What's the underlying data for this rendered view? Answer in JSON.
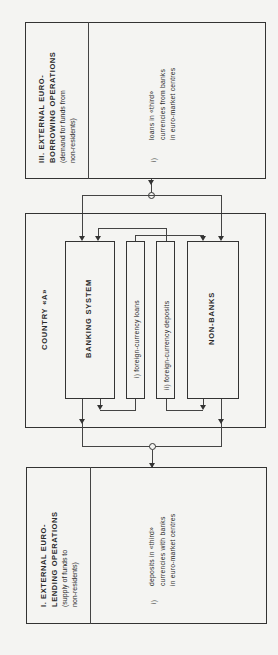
{
  "section_iii": {
    "title_line1": "III.  EXTERNAL   EURO-",
    "title_line2": "BORROWING  OPERATIONS",
    "sub_line1": "(demand for funds from",
    "sub_line2": "non-residents)",
    "item_num": "i)",
    "item_line1": "loans in «third»",
    "item_line2": "currencies from banks",
    "item_line3": "in euro-market centres"
  },
  "country": {
    "title": "COUNTRY  «A»",
    "banking": "BANKING  SYSTEM",
    "loans": "i)  foreign-currency loans",
    "deposits": "ii)  foreign-currency deposits",
    "nonbanks": "NON-BANKS"
  },
  "section_i": {
    "title_line1": "I.  EXTERNAL   EURO-",
    "title_line2": "LENDING  OPERATIONS",
    "sub_line1": "(supply of funds to",
    "sub_line2": "non-residents)",
    "item_num": "i)",
    "item_line1": "deposits in «third»",
    "item_line2": "currencies with banks",
    "item_line3": "in euro-market centres"
  }
}
